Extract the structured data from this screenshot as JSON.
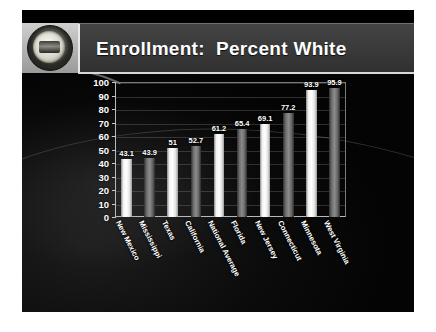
{
  "slide": {
    "title": "Enrollment:  Percent White",
    "seal_icon": "state-seal-icon",
    "background_color": "#050505",
    "title_plate_color": "#3a3a3a",
    "title_text_color": "#ffffff"
  },
  "chart_data": {
    "type": "bar",
    "title": "Enrollment:  Percent White",
    "xlabel": "",
    "ylabel": "",
    "ylim": [
      0,
      100
    ],
    "yticks": [
      100,
      90,
      80,
      70,
      60,
      50,
      40,
      30,
      20,
      10,
      0
    ],
    "grid": true,
    "legend": "none",
    "categories": [
      "New Mexico",
      "Mississippi",
      "Texas",
      "California",
      "National Average",
      "Florida",
      "New Jersey",
      "Connecticut",
      "Minnesota",
      "West Virginia"
    ],
    "values": [
      43.1,
      43.9,
      51,
      52.7,
      61.2,
      65.4,
      69.1,
      77.2,
      93.9,
      95.9
    ],
    "value_labels": [
      "43.1",
      "43.9",
      "51",
      "52.7",
      "61.2",
      "65.4",
      "69.1",
      "77.2",
      "93.9",
      "95.9"
    ],
    "bar_styles": [
      "light",
      "dark",
      "light",
      "dark",
      "light",
      "dark",
      "light",
      "dark",
      "light",
      "dark"
    ],
    "bar_colors": {
      "light": "#ffffff",
      "dark": "#8b8b8b"
    }
  }
}
